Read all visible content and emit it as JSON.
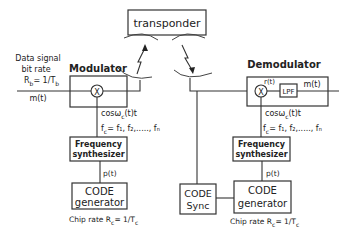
{
  "transponder": {
    "label": "transponder"
  },
  "transmitter": {
    "input_label_line1": "Data signal",
    "input_label_line2": "bit rate",
    "bit_rate_R": "R",
    "bit_rate_sub": "b",
    "bit_rate_eq": "= 1/T",
    "bit_rate_T_sub": "b",
    "signal_in": "m(t)",
    "modulator": {
      "label": "Modulator",
      "mixer_symbol": "X"
    },
    "carrier_label": "cosω",
    "carrier_sub": "c",
    "carrier_suffix": "(t)t",
    "freq_set_label": "f",
    "freq_set_sub": "c",
    "freq_set_values": "= f₁, f₂,....., fₙ",
    "freq_synth": {
      "line1": "Frequency",
      "line2": "synthesizer"
    },
    "pn_label": "p(t)",
    "code_gen": {
      "line1": "CODE",
      "line2": "generator"
    },
    "chip_rate_prefix": "Chip rate R",
    "chip_rate_sub": "c",
    "chip_rate_eq": "= 1/T",
    "chip_rate_T_sub": "c"
  },
  "receiver": {
    "demodulator": {
      "label": "Demodulator",
      "mixer_symbol": "X",
      "filter_label": "LPF",
      "mixer_out": "r(t)"
    },
    "signal_out": "m(t)",
    "carrier_label": "cosω",
    "carrier_sub": "c",
    "carrier_suffix": "(t)t",
    "freq_set_label": "f",
    "freq_set_sub": "c",
    "freq_set_values": "= f₁, f₂,....., fₙ",
    "freq_synth": {
      "line1": "Frequency",
      "line2": "synthesizer"
    },
    "pn_label": "p(t)",
    "code_sync": {
      "line1": "CODE",
      "line2": "Sync"
    },
    "code_gen": {
      "line1": "CODE",
      "line2": "generator"
    },
    "chip_rate_prefix": "Chip rate R",
    "chip_rate_sub": "c",
    "chip_rate_eq": "= 1/T",
    "chip_rate_T_sub": "c"
  }
}
